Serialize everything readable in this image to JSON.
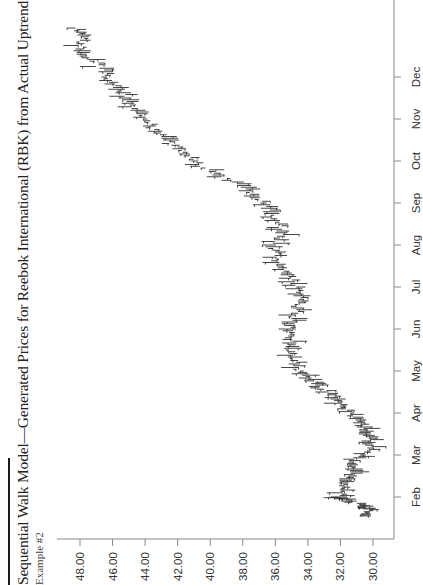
{
  "header": {
    "title": "Sequential Walk Model—Generated Prices for Reebok International (RBK) from Actual Uptrend Prices",
    "subtitle": "Example #2"
  },
  "colors": {
    "axis": "#888888",
    "bars": "#333333",
    "text": "#222222"
  },
  "chart_data": {
    "type": "line",
    "subtype": "high-low-close price bars",
    "orientation": "rotated 90 degrees counterclockwise (price axis horizontal at bottom, time axis vertical on right)",
    "title": "Sequential Walk Model—Generated Prices for Reebok International (RBK) from Actual Uptrend Prices",
    "subtitle": "Example #2",
    "xlabel": "Month",
    "ylabel": "Price",
    "ylim": [
      29.0,
      49.5
    ],
    "y_ticks": [
      "48.00",
      "46.00",
      "44.00",
      "42.00",
      "40.00",
      "38.00",
      "36.00",
      "34.00",
      "32.00",
      "30.00"
    ],
    "x_ticks": [
      "Feb",
      "Mar",
      "Apr",
      "May",
      "Jun",
      "Jul",
      "Aug",
      "Sep",
      "Oct",
      "Nov",
      "Dec"
    ],
    "grid": false,
    "legend": null,
    "series": [
      {
        "name": "RBK generated price",
        "x_month": [
          0.55,
          0.7,
          0.8,
          0.95,
          1.0,
          1.2,
          1.4,
          1.6,
          1.8,
          2.0,
          2.2,
          2.4,
          2.6,
          2.8,
          3.0,
          3.2,
          3.4,
          3.6,
          3.8,
          4.0,
          4.25,
          4.5,
          4.75,
          5.0,
          5.25,
          5.5,
          5.75,
          6.0,
          6.25,
          6.5,
          6.75,
          7.0,
          7.25,
          7.5,
          7.75,
          8.0,
          8.25,
          8.5,
          8.75,
          9.0,
          9.25,
          9.5,
          9.75,
          10.0,
          10.25,
          10.5,
          10.75,
          11.0,
          11.25,
          11.5,
          11.75,
          12.0,
          12.2
        ],
        "values": [
          30.2,
          30.4,
          30.6,
          31.9,
          32.2,
          31.8,
          31.4,
          31.2,
          31.5,
          30.4,
          30.1,
          30.0,
          30.3,
          30.8,
          31.5,
          32.0,
          32.3,
          33.2,
          33.8,
          34.6,
          34.8,
          35.0,
          35.2,
          35.0,
          34.8,
          34.7,
          34.3,
          34.6,
          35.2,
          35.6,
          35.8,
          36.2,
          35.5,
          35.7,
          36.3,
          36.8,
          37.4,
          38.5,
          39.8,
          41.0,
          41.8,
          42.6,
          43.4,
          44.0,
          44.6,
          45.2,
          45.6,
          46.3,
          46.8,
          47.6,
          48.0,
          47.7,
          48.3
        ]
      }
    ]
  }
}
